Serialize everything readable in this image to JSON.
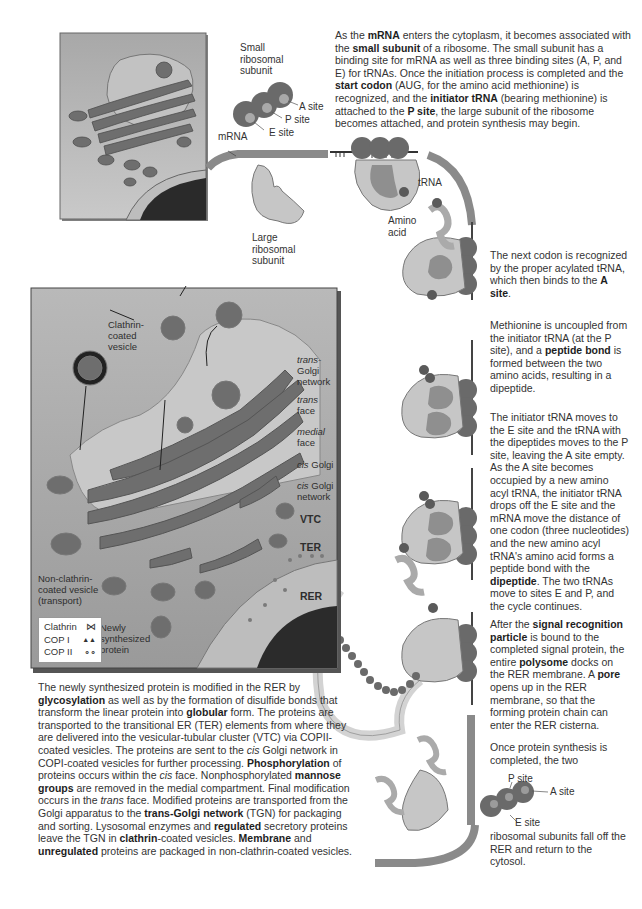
{
  "top_paragraph": {
    "segments": [
      {
        "t": "As the "
      },
      {
        "t": "mRNA",
        "b": true
      },
      {
        "t": " enters the cytoplasm, it becomes associated with the "
      },
      {
        "t": "small subunit",
        "b": true
      },
      {
        "t": " of a ribosome. The small subunit has a binding site for mRNA as well as three binding sites (A, P, and E) for tRNAs. Once the initiation process is completed and the "
      },
      {
        "t": "start codon",
        "b": true
      },
      {
        "t": " (AUG, for the amino acid methionine) is recognized, and the "
      },
      {
        "t": "initiator tRNA",
        "b": true
      },
      {
        "t": " (bearing methionine) is attached to the "
      },
      {
        "t": "P site",
        "b": true
      },
      {
        "t": ", the large subunit of the ribosome becomes attached, and protein synthesis may begin."
      }
    ]
  },
  "top_labels": {
    "small_subunit": "Small ribosomal subunit",
    "a_site": "A site",
    "p_site": "P site",
    "e_site": "E site",
    "mrna": "mRNA",
    "large_subunit": "Large ribosomal subunit",
    "trna": "tRNA",
    "amino_acid": "Amino acid"
  },
  "steps": [
    {
      "segments": [
        {
          "t": "The next codon is recognized by the proper acylated tRNA, which then binds to the "
        },
        {
          "t": "A site",
          "b": true
        },
        {
          "t": "."
        }
      ]
    },
    {
      "segments": [
        {
          "t": "Methionine is uncoupled from the initiator tRNA (at the P site), and a "
        },
        {
          "t": "peptide bond",
          "b": true
        },
        {
          "t": " is formed between the two amino acids, resulting in a dipeptide."
        }
      ]
    },
    {
      "segments": [
        {
          "t": "The initiator tRNA moves to the E site and the tRNA with the dipeptides moves to the P site, leaving the A site empty. As the A site becomes occupied by a new amino acyl tRNA, the initiator tRNA drops off the E site and the mRNA move the distance of one codon (three nucleotides) and the new amino acyl tRNA's amino acid forms a peptide bond with the "
        },
        {
          "t": "dipeptide",
          "b": true
        },
        {
          "t": ". The two tRNAs move to sites E and P, and the cycle continues."
        }
      ]
    },
    {
      "segments": [
        {
          "t": "After the "
        },
        {
          "t": "signal recognition particle",
          "b": true
        },
        {
          "t": " is bound to the completed signal protein, the entire "
        },
        {
          "t": "polysome",
          "b": true
        },
        {
          "t": " docks on the RER membrane. A "
        },
        {
          "t": "pore",
          "b": true
        },
        {
          "t": " opens up in the RER membrane, so that the forming protein chain can enter the RER cisterna."
        }
      ]
    },
    {
      "segments": [
        {
          "t": "Once protein synthesis is completed, the two"
        }
      ]
    }
  ],
  "bottom_ribosome": {
    "p_site": "P site",
    "a_site": "A site",
    "e_site": "E site",
    "caption": "ribosomal subunits fall off the RER and return to the cytosol."
  },
  "golgi_panel": {
    "clathrin_vesicle": "Clathrin-coated vesicle",
    "trans_golgi_network": {
      "i": "trans-",
      "rest": "Golgi network"
    },
    "trans_face": {
      "i": "trans",
      "rest": "face"
    },
    "medial_face": {
      "i": "medial",
      "rest": "face"
    },
    "cis_golgi": {
      "i": "cis",
      "rest": " Golgi"
    },
    "cis_golgi_network": {
      "i": "cis",
      "rest": " Golgi network"
    },
    "vtc": "VTC",
    "ter": "TER",
    "rer": "RER",
    "non_clathrin_vesicle": "Non-clathrin-coated vesicle (transport)",
    "newly_synthesized": "Newly synthesized protein",
    "legend": [
      {
        "label": "Clathrin",
        "symbol": "⋈"
      },
      {
        "label": "COP I",
        "symbol": "▲▲"
      },
      {
        "label": "COP II",
        "symbol": "∘∘"
      }
    ]
  },
  "bottom_paragraph": {
    "segments": [
      {
        "t": "The newly synthesized protein is modified in the RER by "
      },
      {
        "t": "glycosylation",
        "b": true
      },
      {
        "t": " as well as by the formation of disulfide bonds that transform the linear protein into "
      },
      {
        "t": "globular",
        "b": true
      },
      {
        "t": " form. The proteins are transported to the transitional ER (TER) elements from where they are delivered into the vesicular-tubular cluster (VTC) via COPII-coated vesicles. The proteins are sent to the "
      },
      {
        "t": "cis",
        "i": true
      },
      {
        "t": " Golgi network in COPI-coated vesicles for further processing. "
      },
      {
        "t": "Phosphorylation",
        "b": true
      },
      {
        "t": " of proteins occurs within the "
      },
      {
        "t": "cis",
        "i": true
      },
      {
        "t": " face. Nonphosphorylated "
      },
      {
        "t": "mannose groups",
        "b": true
      },
      {
        "t": " are removed in the medial compartment. Final modification occurs in the "
      },
      {
        "t": "trans",
        "i": true
      },
      {
        "t": " face. Modified proteins are transported from the Golgi apparatus to the "
      },
      {
        "t": "trans-Golgi network",
        "b": true
      },
      {
        "t": " (TGN) for packaging and sorting. Lysosomal enzymes and "
      },
      {
        "t": "regulated",
        "b": true
      },
      {
        "t": " secretory proteins leave the TGN in "
      },
      {
        "t": "clathrin",
        "b": true
      },
      {
        "t": "-coated vesicles. "
      },
      {
        "t": "Membrane",
        "b": true
      },
      {
        "t": " and "
      },
      {
        "t": "unregulated",
        "b": true
      },
      {
        "t": " proteins are packaged in non-clathrin-coated vesicles."
      }
    ]
  },
  "colors": {
    "dark_gray": "#5a5a5a",
    "mid_gray": "#8c8c8c",
    "light_gray": "#c8c8c8",
    "panel_bg": "#a9a9a9",
    "nucleus": "#2b2b2b"
  }
}
